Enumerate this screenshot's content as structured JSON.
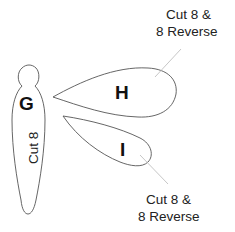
{
  "pieces": [
    {
      "id": "G",
      "letter": "G",
      "instruction": "Cut 8"
    },
    {
      "id": "H",
      "letter": "H",
      "instruction_line1": "Cut 8 &",
      "instruction_line2": "8 Reverse"
    },
    {
      "id": "I",
      "letter": "I",
      "instruction_line1": "Cut 8 &",
      "instruction_line2": "8 Reverse"
    }
  ],
  "colors": {
    "outline": "#555555",
    "leader": "#bfbfbf",
    "text": "#222222",
    "background": "#ffffff"
  }
}
